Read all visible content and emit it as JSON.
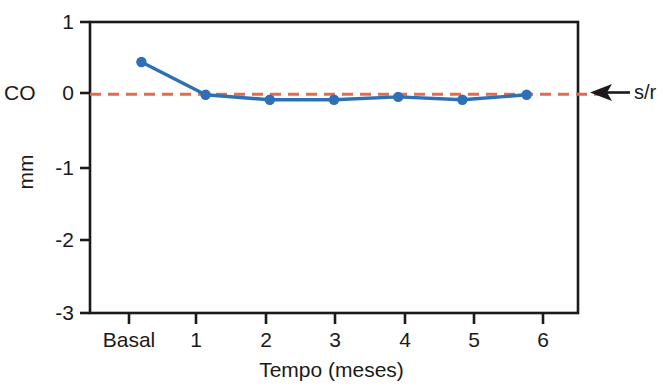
{
  "chart_data": {
    "type": "line",
    "title": "",
    "xlabel": "Tempo (meses)",
    "ylabel": "mm",
    "categories": [
      "Basal",
      "1",
      "2",
      "3",
      "4",
      "5",
      "6"
    ],
    "values": [
      0.45,
      0.0,
      -0.07,
      -0.07,
      -0.03,
      -0.07,
      0.0
    ],
    "series": [
      {
        "name": "CO",
        "values": [
          0.45,
          0.0,
          -0.07,
          -0.07,
          -0.03,
          -0.07,
          0.0
        ],
        "color": "#2f6fb5",
        "marker": "circle"
      }
    ],
    "ylim": [
      -3,
      1
    ],
    "yticks": [
      "1",
      "0",
      "-1",
      "-2",
      "-3"
    ],
    "ytick_values": [
      1,
      0,
      -1,
      -2,
      -3
    ],
    "grid": false,
    "legend": "none",
    "reference_line": {
      "label": "s/r",
      "value": 0,
      "style": "dashed",
      "color": "#e8694a"
    },
    "annotations": [
      {
        "name": "co-axis-label",
        "text": "CO",
        "position": "left-of-zero-tick"
      },
      {
        "name": "sr-arrow-annotation",
        "text": "s/r",
        "position": "right-of-plot",
        "arrow": "left"
      }
    ]
  },
  "axis": {
    "y_label": "mm",
    "x_label": "Tempo (meses)",
    "co_label": "CO",
    "ticks_y": [
      "1",
      "0",
      "-1",
      "-2",
      "-3"
    ],
    "ticks_x": [
      "Basal",
      "1",
      "2",
      "3",
      "4",
      "5",
      "6"
    ]
  },
  "annotation": {
    "sr_text": "s/r"
  }
}
